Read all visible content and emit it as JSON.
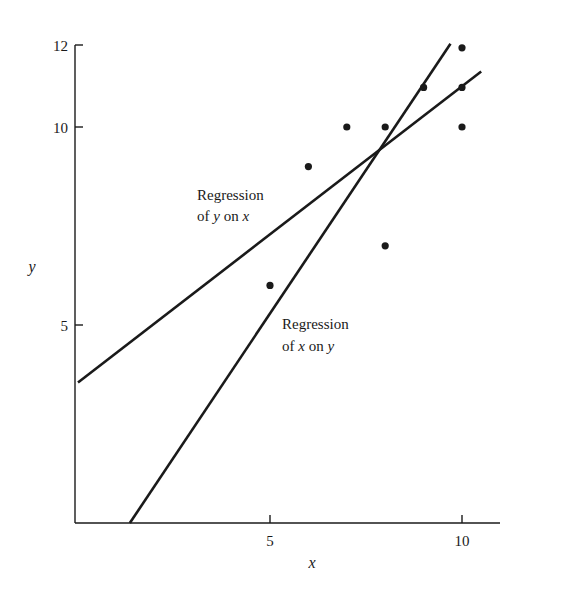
{
  "chart_data": {
    "type": "scatter",
    "title": "",
    "xlabel": "x",
    "ylabel": "y",
    "xlim": [
      0,
      12
    ],
    "ylim": [
      0,
      12
    ],
    "x_ticks": [
      5,
      10
    ],
    "y_ticks": [
      5,
      10,
      12
    ],
    "grid": false,
    "legend": null,
    "points": [
      {
        "x": 5,
        "y": 6
      },
      {
        "x": 6,
        "y": 9
      },
      {
        "x": 7,
        "y": 10
      },
      {
        "x": 8,
        "y": 10
      },
      {
        "x": 8,
        "y": 7
      },
      {
        "x": 9,
        "y": 11
      },
      {
        "x": 10,
        "y": 12
      },
      {
        "x": 10,
        "y": 11
      },
      {
        "x": 10,
        "y": 10
      }
    ],
    "lines": [
      {
        "name": "Regression of y on x",
        "x_start": 0,
        "y_start": 3.55,
        "x_end": 10.5,
        "y_end": 11.4
      },
      {
        "name": "Regression of x on y",
        "x_start": 1.35,
        "y_start": 0,
        "x_end": 9.7,
        "y_end": 12.1
      }
    ],
    "annotations": [
      {
        "line1": "Regression",
        "line2_prefix": "of ",
        "line2_var1": "y",
        "line2_mid": " on ",
        "line2_var2": "x",
        "x_px": 197,
        "y_px": 200
      },
      {
        "line1": "Regression",
        "line2_prefix": "of ",
        "line2_var1": "x",
        "line2_mid": " on ",
        "line2_var2": "y",
        "x_px": 282,
        "y_px": 329
      }
    ]
  },
  "axes": {
    "x_label": "x",
    "y_label": "y",
    "x_tick_labels": [
      "5",
      "10"
    ],
    "y_tick_labels": [
      "5",
      "10",
      "12"
    ]
  },
  "colors": {
    "ink": "#1a1a1a",
    "background": "#ffffff"
  }
}
